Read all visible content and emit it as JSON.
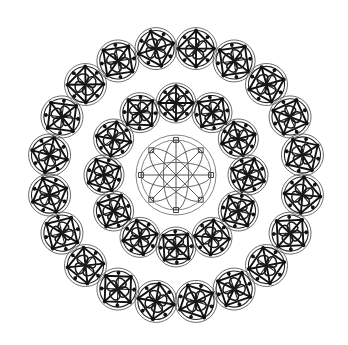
{
  "artwork": {
    "title": "Concentric Mandala Ring Pattern",
    "description": "Radially symmetric black line-art composition: one large eight-petal rosette at center surrounded by two concentric rings of small circular mandala motifs.",
    "background_color": "#ffffff",
    "ink_color": "#111111",
    "light_ink_color": "#777777",
    "canvas": {
      "width": 348,
      "height": 345
    },
    "center": {
      "x": 176,
      "y": 175
    }
  },
  "center_motif": {
    "name": "flower-of-life-rosette",
    "radius": 40,
    "inner_ring_radius": 35,
    "petal_count": 8,
    "spoke_count": 8,
    "marker_count": 8,
    "marker_radius": 2.4,
    "stroke_color": "#666666"
  },
  "motif_template": {
    "name": "small-mandala",
    "parts": [
      "outer-thin-circle",
      "inner-circle",
      "inscribed-square",
      "orthogonal-cross",
      "pinwheel-petals",
      "endpoint-nodes"
    ],
    "petal_count": 4,
    "node_count": 8,
    "node_radius": 1.9
  },
  "rings": [
    {
      "name": "inner-ring",
      "count": 12,
      "orbit_radius": 72,
      "motif_radius": 20,
      "start_angle_deg": -90
    },
    {
      "name": "outer-ring",
      "count": 20,
      "orbit_radius": 128,
      "motif_radius": 21,
      "start_angle_deg": -81
    }
  ],
  "stats": {
    "total_motifs": 33,
    "inner_ring_label": "12 motifs",
    "outer_ring_label": "20 motifs",
    "center_label": "1 rosette"
  }
}
